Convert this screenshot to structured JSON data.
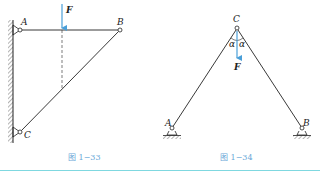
{
  "figures": [
    {
      "id": "fig-1-33",
      "caption": "图 1−33",
      "labels": {
        "A": "A",
        "B": "B",
        "C": "C",
        "force": "F"
      }
    },
    {
      "id": "fig-1-34",
      "caption": "图 1−34",
      "labels": {
        "A": "A",
        "B": "B",
        "C": "C",
        "force": "F",
        "angle_left": "α",
        "angle_right": "α"
      }
    }
  ],
  "colors": {
    "force_arrow": "#4a9fd8",
    "caption": "#6aa8d8",
    "rule": "#7fd8e0",
    "line": "#222222"
  }
}
